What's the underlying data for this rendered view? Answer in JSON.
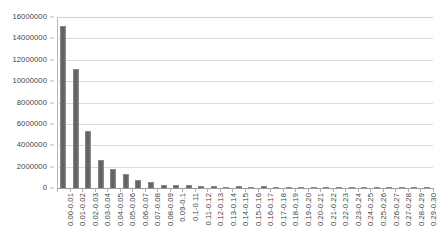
{
  "chart_data": {
    "type": "bar",
    "title": "",
    "subtitle": "",
    "xlabel": "",
    "ylabel": "",
    "ylim": [
      0,
      16000000
    ],
    "grid": true,
    "legend": false,
    "legend_position": "none",
    "orientation": "vertical",
    "bar_color": "#6d6d6d",
    "gridline_color": "#d9d9d9",
    "axis_color": "#9a9a9a",
    "text_color": "#3f3f3f",
    "y_ticks": [
      "0",
      "2000000",
      "4000000",
      "6000000",
      "8000000",
      "10000000",
      "12000000",
      "14000000",
      "16000000"
    ],
    "y_tick_values": [
      0,
      2000000,
      4000000,
      6000000,
      8000000,
      10000000,
      12000000,
      14000000,
      16000000
    ],
    "categories": [
      "0.00-0.01",
      "0.01-0.02",
      "0.02-0.03",
      "0.03-0.04",
      "0.04-0.05",
      "0.05-0.06",
      "0.06-0.07",
      "0.07-0.08",
      "0.08-0.09",
      "0.09-0.1",
      "0.1-0.11",
      "0.11-0.12",
      "0.12-0.13",
      "0.13-0.14",
      "0.14-0.15",
      "0.15-0.16",
      "0.16-0.17",
      "0.17-0.18",
      "0.18-0.19",
      "0.19-0.20",
      "0.20-0.21",
      "0.21-0.22",
      "0.22-0.23",
      "0.23-0.24",
      "0.24-0.25",
      "0.25-0.26",
      "0.26-0.27",
      "0.27-0.28",
      "0.28-0.29",
      "0.29-0.30"
    ],
    "values": [
      15150000,
      11100000,
      5350000,
      2650000,
      1750000,
      1300000,
      720000,
      560000,
      300000,
      250000,
      240000,
      215000,
      150000,
      60000,
      150000,
      55000,
      170000,
      45000,
      40000,
      45000,
      110000,
      45000,
      40000,
      45000,
      45000,
      140000,
      45000,
      40000,
      35000,
      40000
    ]
  }
}
